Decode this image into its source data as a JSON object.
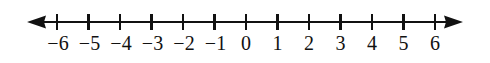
{
  "figure": {
    "background_color": "#ffffff",
    "ink_color": "#111111"
  },
  "chart_data": {
    "type": "line",
    "title": "",
    "subtitle": "",
    "xlabel": "",
    "ylabel": "",
    "orientation": "horizontal",
    "grid": false,
    "legend": null,
    "axis_style": "double-headed-arrow",
    "xlim": [
      -6.95,
      6.9
    ],
    "tick_values": [
      -6,
      -5,
      -4,
      -3,
      -2,
      -1,
      0,
      1,
      2,
      3,
      4,
      5,
      6
    ],
    "tick_labels": [
      "−6",
      "−5",
      "−4",
      "−3",
      "−2",
      "−1",
      "0",
      "1",
      "2",
      "3",
      "4",
      "5",
      "6"
    ],
    "tick_spacing_px": 31.3,
    "values": [],
    "plotted_points": [],
    "annotations": []
  },
  "geometry": {
    "width": 490,
    "height": 63,
    "axis_y": 22,
    "tick_top": 14,
    "tick_bottom": 30,
    "label_baseline": 50,
    "left_arrow_tip_x": 27,
    "right_arrow_tip_x": 463,
    "first_tick_x": 57,
    "last_tick_x": 435
  },
  "arrows": {
    "left_name": "left-arrowhead",
    "right_name": "right-arrowhead"
  }
}
